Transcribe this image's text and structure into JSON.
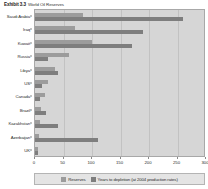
{
  "title": {
    "exhibit": "Exhibit 3.3",
    "text": "World Oil Reserves"
  },
  "chart_data": {
    "type": "bar",
    "orientation": "horizontal",
    "title": "World Oil Reserves",
    "xlabel": "",
    "ylabel": "",
    "xlim": [
      0,
      300
    ],
    "xticks": [
      0,
      50,
      100,
      150,
      200,
      250,
      300
    ],
    "xtick_labels": [
      "0",
      "50",
      "100",
      "150",
      "200",
      "250",
      "300"
    ],
    "grid": true,
    "legend_position": "bottom",
    "categories": [
      "Saudi Arabia",
      "Iraq",
      "Kuwait",
      "Russia",
      "Libya",
      "US",
      "Canada",
      "Brazil",
      "Kazakhstan",
      "Azerbaijan",
      "UK"
    ],
    "series": [
      {
        "name": "Reserves",
        "color": "#9c9c9c",
        "values": [
          85,
          70,
          100,
          60,
          35,
          22,
          17,
          11,
          9,
          7,
          5
        ]
      },
      {
        "name": "Years to depletion (at 2004 production rates)",
        "color": "#7e7e7e",
        "values": [
          260,
          190,
          170,
          22,
          40,
          12,
          8,
          20,
          40,
          110,
          6
        ]
      }
    ]
  },
  "legend": {
    "items": [
      {
        "label": "Reserves"
      },
      {
        "label": "Years to depletion (at 2004 production rates)"
      }
    ]
  },
  "colors": {
    "plot_background": "#d6d6d6",
    "legend_background": "#e4e4e4",
    "series0": "#9c9c9c",
    "series1": "#7e7e7e",
    "gridline": "#c2c2c2",
    "axis": "#8a8a8a"
  }
}
